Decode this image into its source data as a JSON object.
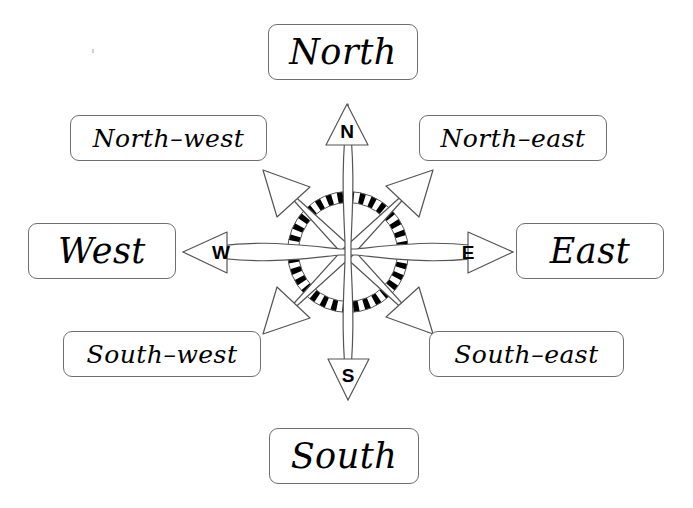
{
  "diagram": {
    "background_color": "#ffffff",
    "stroke_color": "#555555",
    "fill_color": "#ffffff",
    "ring_dark_color": "#000000",
    "label_border_color": "#6f6f6f"
  },
  "labels": {
    "north": "North",
    "south": "South",
    "west": "West",
    "east": "East",
    "north_west": "North–west",
    "north_east": "North–east",
    "south_west": "South–west",
    "south_east": "South–east"
  },
  "markers": {
    "n": "N",
    "s": "S",
    "w": "W",
    "e": "E"
  },
  "rose": {
    "center_x": 348,
    "center_y": 252,
    "ring_radius": 55,
    "ring_segments": 32,
    "points": 8
  }
}
